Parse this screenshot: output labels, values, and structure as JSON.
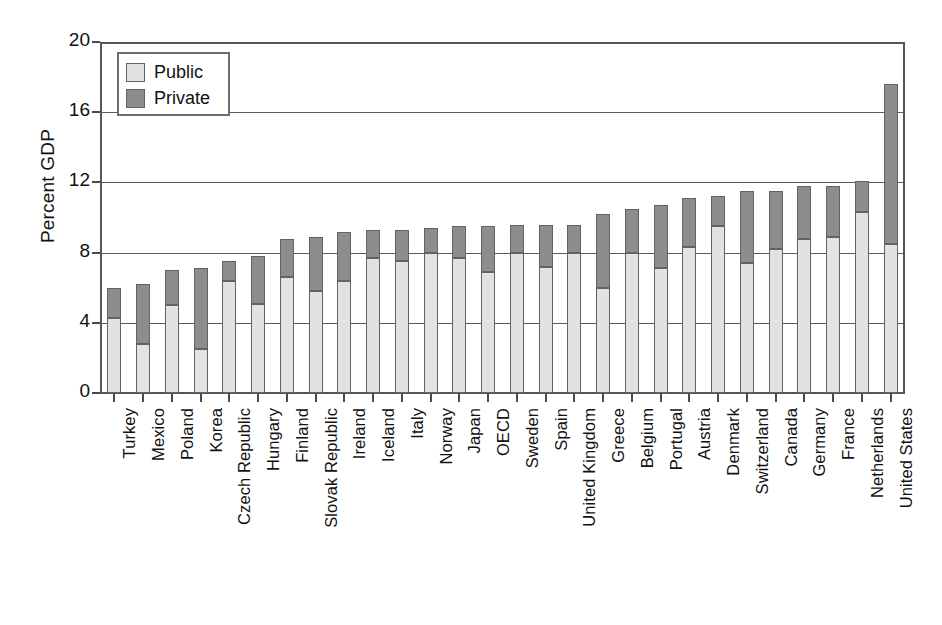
{
  "chart_data": {
    "type": "bar",
    "subtype": "stacked-bar",
    "title": "",
    "xlabel": "",
    "ylabel": "Percent GDP",
    "ylim": [
      0,
      20
    ],
    "yticks": [
      0,
      4,
      8,
      12,
      16,
      20
    ],
    "ytick_labels": [
      "0",
      "4",
      "8",
      "12",
      "16",
      "20"
    ],
    "grid": "horizontal",
    "legend_position": "top-left",
    "legend": [
      "Public",
      "Private"
    ],
    "colors": {
      "public": "#e2e2e2",
      "private": "#8d8d8d",
      "outline": "#636363",
      "axis": "#555555",
      "text": "#111111"
    },
    "categories": [
      "Turkey",
      "Mexico",
      "Poland",
      "Korea",
      "Czech Republic",
      "Hungary",
      "Finland",
      "Slovak Republic",
      "Ireland",
      "Iceland",
      "Italy",
      "Norway",
      "Japan",
      "OECD",
      "Sweden",
      "Spain",
      "United Kingdom",
      "Greece",
      "Belgium",
      "Portugal",
      "Austria",
      "Denmark",
      "Switzerland",
      "Canada",
      "Germany",
      "France",
      "Netherlands",
      "United States"
    ],
    "series": [
      {
        "name": "Public",
        "values": [
          4.3,
          2.8,
          5.0,
          2.5,
          6.4,
          5.1,
          6.6,
          5.8,
          6.4,
          7.7,
          7.5,
          8.0,
          7.7,
          6.9,
          8.0,
          7.2,
          8.0,
          6.0,
          8.0,
          7.1,
          8.3,
          9.5,
          7.4,
          8.2,
          8.8,
          8.9,
          10.3,
          8.5
        ]
      },
      {
        "name": "Private",
        "values": [
          1.7,
          3.4,
          2.0,
          4.6,
          1.1,
          2.7,
          2.2,
          3.1,
          2.8,
          1.6,
          1.8,
          1.4,
          1.8,
          2.6,
          1.6,
          2.4,
          1.6,
          4.2,
          2.5,
          3.6,
          2.8,
          1.7,
          4.1,
          3.3,
          3.0,
          2.9,
          1.8,
          9.1
        ]
      }
    ],
    "totals": [
      6.0,
      6.2,
      7.0,
      7.1,
      7.5,
      7.8,
      8.8,
      8.9,
      9.2,
      9.3,
      9.3,
      9.4,
      9.5,
      9.5,
      9.6,
      9.6,
      9.6,
      10.2,
      10.5,
      10.7,
      11.1,
      11.2,
      11.5,
      11.5,
      11.8,
      11.8,
      12.1,
      17.6
    ]
  }
}
